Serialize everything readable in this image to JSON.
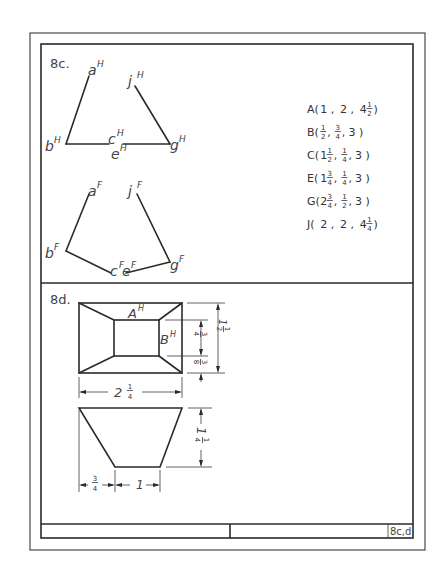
{
  "sheet": {
    "title_block_number": "8c,d"
  },
  "problem_8c": {
    "label": "8c.",
    "top_view_labels": {
      "a": "a",
      "b": "b",
      "c": "c",
      "e": "e",
      "g": "g",
      "j": "j",
      "sup": "H"
    },
    "front_view_labels": {
      "a": "a",
      "b": "b",
      "c": "c",
      "e": "e",
      "g": "g",
      "j": "j",
      "sup": "F"
    },
    "coordinates": [
      {
        "point": "A",
        "x": "1",
        "y": "2",
        "z_whole": "4",
        "z_num": "1",
        "z_den": "2"
      },
      {
        "point": "B",
        "x_num": "1",
        "x_den": "2",
        "y_num": "3",
        "y_den": "4",
        "z": "3"
      },
      {
        "point": "C",
        "x_whole": "1",
        "x_num": "1",
        "x_den": "2",
        "y_num": "1",
        "y_den": "4",
        "z": "3"
      },
      {
        "point": "E",
        "x_whole": "1",
        "x_num": "3",
        "x_den": "4",
        "y_num": "1",
        "y_den": "4",
        "z": "3"
      },
      {
        "point": "G",
        "x_whole": "2",
        "x_num": "3",
        "x_den": "4",
        "y_num": "1",
        "y_den": "2",
        "z": "3"
      },
      {
        "point": "J",
        "x": "2",
        "y": "2",
        "z_whole": "4",
        "z_num": "1",
        "z_den": "4"
      }
    ],
    "coordinate_text": [
      "A(1 ,2 ,4½)",
      "B( ½, ¾,3 )",
      "C(1½, ¼,3 )",
      "E(1¾, ¼,3 )",
      "G(2¾, ½,3 )",
      "J(2 ,2 ,4¼)"
    ]
  },
  "problem_8d": {
    "label": "8d.",
    "point_labels": {
      "A": "A",
      "B": "B",
      "sup": "H"
    },
    "dimensions": {
      "top_width": {
        "whole": "2",
        "num": "1",
        "den": "4"
      },
      "total_depth": {
        "whole": "1",
        "num": "1",
        "den": "2"
      },
      "inner_depth": {
        "num": "3",
        "den": "4"
      },
      "offset_depth": {
        "num": "3",
        "den": "8"
      },
      "height": {
        "whole": "1",
        "num": "1",
        "den": "4"
      },
      "left_offset": {
        "num": "3",
        "den": "4"
      },
      "bottom_width": "1"
    }
  }
}
